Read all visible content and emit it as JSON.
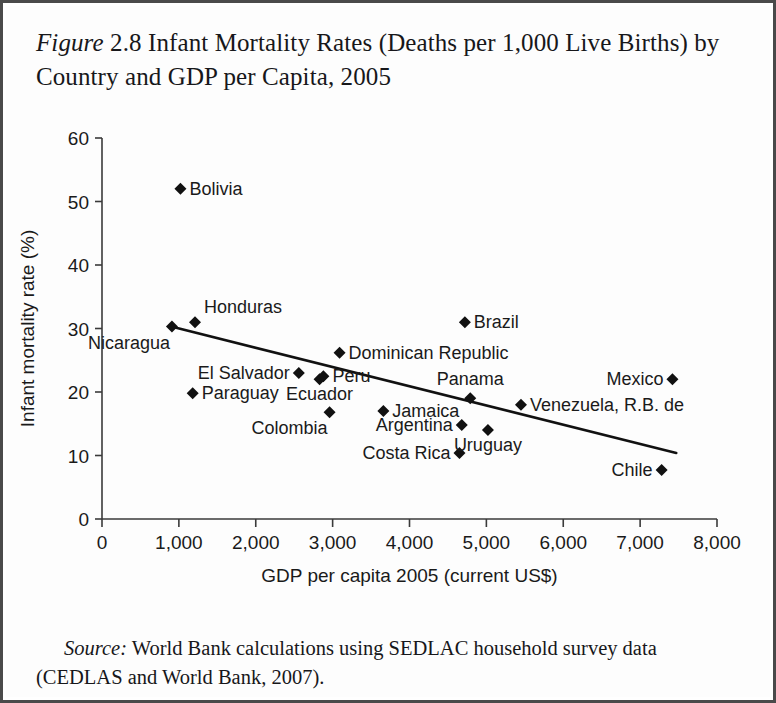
{
  "figure": {
    "label": "Figure",
    "number": "2.8",
    "title": "Infant Mortality Rates (Deaths per 1,000 Live Births) by Country and GDP per Capita, 2005",
    "full_caption": "Figure 2.8 Infant Mortality Rates (Deaths per 1,000 Live Births) by Country and GDP per Capita, 2005"
  },
  "source": {
    "label": "Source:",
    "line1": "World Bank calculations using SEDLAC household survey data",
    "line2": "(CEDLAS and World Bank, 2007).",
    "full_text": "Source: World Bank calculations using SEDLAC household survey data (CEDLAS and World Bank, 2007)."
  },
  "colors": {
    "ink": "#1a1a1a",
    "axis": "#3a3a3a",
    "marker": "#111111",
    "trendline": "#111111",
    "page_border": "#4a4a4a",
    "background": "#ffffff"
  },
  "chart_data": {
    "type": "scatter",
    "title": "Infant Mortality Rates (Deaths per 1,000 Live Births) by Country and GDP per Capita, 2005",
    "xlabel": "GDP per capita 2005 (current US$)",
    "ylabel": "Infant mortality rate (%)",
    "xlim": [
      0,
      8000
    ],
    "ylim": [
      0,
      60
    ],
    "xticks": [
      0,
      1000,
      2000,
      3000,
      4000,
      5000,
      6000,
      7000,
      8000
    ],
    "xticklabels": [
      "0",
      "1,000",
      "2,000",
      "3,000",
      "4,000",
      "5,000",
      "6,000",
      "7,000",
      "8,000"
    ],
    "yticks": [
      0,
      10,
      20,
      30,
      40,
      50,
      60
    ],
    "yticklabels": [
      "0",
      "10",
      "20",
      "30",
      "40",
      "50",
      "60"
    ],
    "grid": false,
    "legend": false,
    "marker_shape": "diamond",
    "points": [
      {
        "label": "Bolivia",
        "x": 1020,
        "y": 52.0,
        "label_pos": "right"
      },
      {
        "label": "Nicaragua",
        "x": 910,
        "y": 30.3,
        "label_pos": "below-left"
      },
      {
        "label": "Honduras",
        "x": 1210,
        "y": 31.0,
        "label_pos": "above-right"
      },
      {
        "label": "Paraguay",
        "x": 1180,
        "y": 19.8,
        "label_pos": "right"
      },
      {
        "label": "El Salvador",
        "x": 2560,
        "y": 23.0,
        "label_pos": "left"
      },
      {
        "label": "Ecuador",
        "x": 2830,
        "y": 22.0,
        "label_pos": "below"
      },
      {
        "label": "Peru",
        "x": 2880,
        "y": 22.5,
        "label_pos": "right"
      },
      {
        "label": "Colombia",
        "x": 2960,
        "y": 16.8,
        "label_pos": "below-left"
      },
      {
        "label": "Dominican Republic",
        "x": 3090,
        "y": 26.2,
        "label_pos": "right"
      },
      {
        "label": "Jamaica",
        "x": 3660,
        "y": 17.0,
        "label_pos": "right"
      },
      {
        "label": "Costa Rica",
        "x": 4650,
        "y": 10.4,
        "label_pos": "left"
      },
      {
        "label": "Argentina",
        "x": 4680,
        "y": 14.8,
        "label_pos": "left"
      },
      {
        "label": "Brazil",
        "x": 4720,
        "y": 31.0,
        "label_pos": "right"
      },
      {
        "label": "Panama",
        "x": 4790,
        "y": 19.0,
        "label_pos": "above"
      },
      {
        "label": "Uruguay",
        "x": 5020,
        "y": 14.0,
        "label_pos": "below"
      },
      {
        "label": "Venezuela, R.B. de",
        "x": 5450,
        "y": 18.0,
        "label_pos": "right"
      },
      {
        "label": "Chile",
        "x": 7280,
        "y": 7.7,
        "label_pos": "left"
      },
      {
        "label": "Mexico",
        "x": 7420,
        "y": 22.0,
        "label_pos": "left"
      }
    ],
    "trendline": {
      "type": "linear-fit",
      "x_start": 900,
      "y_start": 30.3,
      "x_end": 7470,
      "y_end": 10.4
    }
  }
}
